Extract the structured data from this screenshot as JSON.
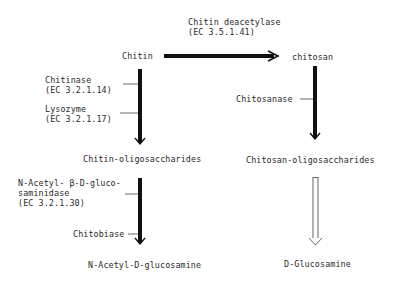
{
  "diagram": {
    "nodes": {
      "chitin": "Chitin",
      "chitosan": "chitosan",
      "chitin_oligo": "Chitin-oligosaccharides",
      "chitosan_oligo": "Chitosan-oligosaccharides",
      "glcnac": "N-Acetyl-D-glucosamine",
      "glucosamine": "D-Glucosamine"
    },
    "enzymes": {
      "deacetylase_name": "Chitin deacetylase",
      "deacetylase_ec": "(EC 3.5.1.41)",
      "chitinase_name": "Chitinase",
      "chitinase_ec": "(EC 3.2.1.14)",
      "lysozyme_name": "Lysozyme",
      "lysozyme_ec": "(EC 3.2.1.17)",
      "chitosanase_name": "Chitosanase",
      "nag_line1": "N-Acetyl- β-D-gluco-",
      "nag_line2": "saminidase",
      "nag_ec": "(EC 3.2.1.30)",
      "chitobiase_name": "Chitobiase"
    },
    "edges": [
      {
        "from": "Chitin",
        "to": "chitosan",
        "style": "solid-bold",
        "enzymes": [
          "Chitin deacetylase (EC 3.5.1.41)"
        ]
      },
      {
        "from": "Chitin",
        "to": "Chitin-oligosaccharides",
        "style": "solid-bold",
        "enzymes": [
          "Chitinase (EC 3.2.1.14)",
          "Lysozyme (EC 3.2.1.17)"
        ]
      },
      {
        "from": "chitosan",
        "to": "Chitosan-oligosaccharides",
        "style": "solid-bold",
        "enzymes": [
          "Chitosanase"
        ]
      },
      {
        "from": "Chitin-oligosaccharides",
        "to": "N-Acetyl-D-glucosamine",
        "style": "solid-bold",
        "enzymes": [
          "N-Acetyl-β-D-glucosaminidase (EC 3.2.1.30)",
          "Chitobiase"
        ]
      },
      {
        "from": "Chitosan-oligosaccharides",
        "to": "D-Glucosamine",
        "style": "hollow",
        "enzymes": []
      }
    ]
  }
}
